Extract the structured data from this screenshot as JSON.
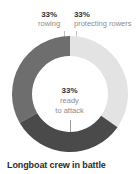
{
  "caption": "Longboat crew in battle",
  "callouts": {
    "rowing": {
      "pct": "33%",
      "desc": "rowing"
    },
    "protecting": {
      "pct": "33%",
      "desc": "protecting rowers"
    }
  },
  "center": {
    "pct": "33%",
    "line1": "ready",
    "line2": "to attack"
  },
  "colors": {
    "rowing": "#6e6e6e",
    "protecting": "#e3e3e3",
    "ready": "#4a4a4a",
    "leader": "#bfbfbf",
    "pct_text": "#333333",
    "desc_text": "#8c8c8c",
    "caption_text": "#2b2b2b",
    "background": "#ffffff"
  },
  "chart_data": {
    "type": "pie",
    "title": "Longboat crew in battle",
    "subtitle": "",
    "xlabel": "",
    "ylabel": "",
    "donut": true,
    "inner_radius_ratio": 0.655,
    "start_angle_deg": 0,
    "direction": "clockwise",
    "grid": false,
    "legend_position": "callouts",
    "categories": [
      "rowing",
      "protecting rowers",
      "ready to attack"
    ],
    "values": [
      33,
      33,
      33
    ],
    "unit": "%",
    "slices": [
      {
        "label": "rowing",
        "value": 33,
        "display": "33%",
        "color": "#6e6e6e",
        "start_deg": 240,
        "end_deg": 360
      },
      {
        "label": "protecting rowers",
        "value": 33,
        "display": "33%",
        "color": "#e3e3e3",
        "start_deg": 0,
        "end_deg": 125
      },
      {
        "label": "ready to attack",
        "value": 33,
        "display": "33%",
        "color": "#4a4a4a",
        "start_deg": 125,
        "end_deg": 240
      }
    ],
    "annotations": [
      {
        "text": "33% rowing",
        "target": "rowing",
        "position": "top-left"
      },
      {
        "text": "33% protecting rowers",
        "target": "protecting rowers",
        "position": "top-right"
      },
      {
        "text": "33% ready to attack",
        "target": "ready to attack",
        "position": "center"
      }
    ]
  }
}
